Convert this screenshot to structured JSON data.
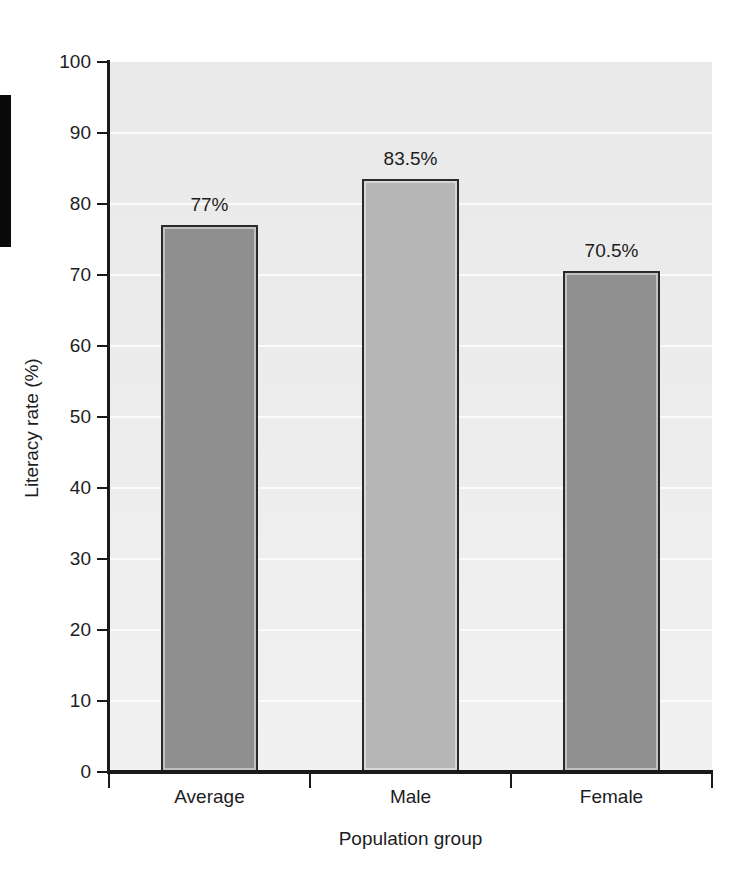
{
  "chart_data": {
    "type": "bar",
    "title": "",
    "categories": [
      "Average",
      "Male",
      "Female"
    ],
    "values": [
      77,
      83.5,
      70.5
    ],
    "value_labels": [
      "77%",
      "83.5%",
      "70.5%"
    ],
    "xlabel": "Population group",
    "ylabel": "Literacy rate (%)",
    "ylim": [
      0,
      100
    ],
    "ytick_labels": [
      "0",
      "10",
      "20",
      "30",
      "40",
      "50",
      "60",
      "70",
      "80",
      "90",
      "100"
    ],
    "ytick_values": [
      0,
      10,
      20,
      30,
      40,
      50,
      60,
      70,
      80,
      90,
      100
    ],
    "grid": "horizontal",
    "legend": "none",
    "bar_colors": [
      "#8f8f8f",
      "#b6b6b6",
      "#909090"
    ],
    "bar_edge_color": "#2a2a2a",
    "plot_background": "#ebebeb",
    "gridline_color": "#fbfbfb",
    "axis_color": "#1a1a1a",
    "text_color": "#1d1d1d"
  }
}
